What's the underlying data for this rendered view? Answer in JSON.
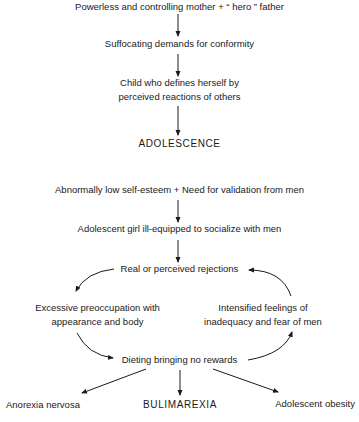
{
  "diagram": {
    "nodes": {
      "origin": "Powerless and controlling mother +  “ hero ” father",
      "conformity": "Suffocating demands for conformity",
      "child_line1": "Child who defines herself by",
      "child_line2": "perceived reactions of others",
      "adolescence": "ADOLESCENCE",
      "esteem": "Abnormally low self-esteem  + Need for validation from men",
      "ill_equipped": "Adolescent girl ill-equipped to socialize with men",
      "rejections": "Real or perceived rejections",
      "preoccupation_line1": "Excessive preoccupation with",
      "preoccupation_line2": "appearance and body",
      "inadequacy_line1": "Intensified feelings of",
      "inadequacy_line2": "inadequacy and fear of men",
      "dieting": "Dieting bringing no rewards",
      "anorexia": "Anorexia nervosa",
      "bulimarexia": "BULIMAREXIA",
      "obesity": "Adolescent obesity"
    },
    "edges": [
      {
        "from": "origin",
        "to": "conformity"
      },
      {
        "from": "conformity",
        "to": "child"
      },
      {
        "from": "child",
        "to": "adolescence"
      },
      {
        "from": "esteem",
        "to": "ill_equipped"
      },
      {
        "from": "ill_equipped",
        "to": "rejections"
      },
      {
        "from": "rejections",
        "to": "preoccupation"
      },
      {
        "from": "preoccupation",
        "to": "dieting"
      },
      {
        "from": "dieting",
        "to": "inadequacy"
      },
      {
        "from": "inadequacy",
        "to": "rejections"
      },
      {
        "from": "dieting",
        "to": "anorexia"
      },
      {
        "from": "dieting",
        "to": "bulimarexia"
      },
      {
        "from": "dieting",
        "to": "obesity"
      }
    ],
    "colors": {
      "text": "#1a1a1a",
      "arrow": "#1a1a1a",
      "background": "#ffffff"
    }
  }
}
